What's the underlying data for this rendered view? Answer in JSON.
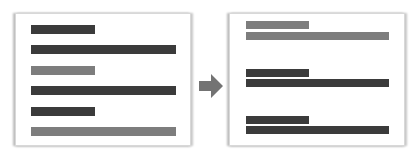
{
  "diagram": {
    "colors": {
      "dark": "#3b3b3b",
      "gray": "#7d7d7d",
      "arrow": "#737373"
    },
    "before": {
      "bars": [
        {
          "length": "short",
          "tone": "dark"
        },
        {
          "length": "long",
          "tone": "dark"
        },
        {
          "length": "short",
          "tone": "gray"
        },
        {
          "length": "long",
          "tone": "dark"
        },
        {
          "length": "short",
          "tone": "dark"
        },
        {
          "length": "long",
          "tone": "gray"
        }
      ]
    },
    "arrow": {
      "direction": "right"
    },
    "after": {
      "groups": [
        {
          "tone": "gray",
          "bars": [
            "short",
            "long"
          ]
        },
        {
          "tone": "dark",
          "bars": [
            "short",
            "long"
          ]
        },
        {
          "tone": "dark",
          "bars": [
            "short",
            "long"
          ]
        }
      ]
    }
  }
}
